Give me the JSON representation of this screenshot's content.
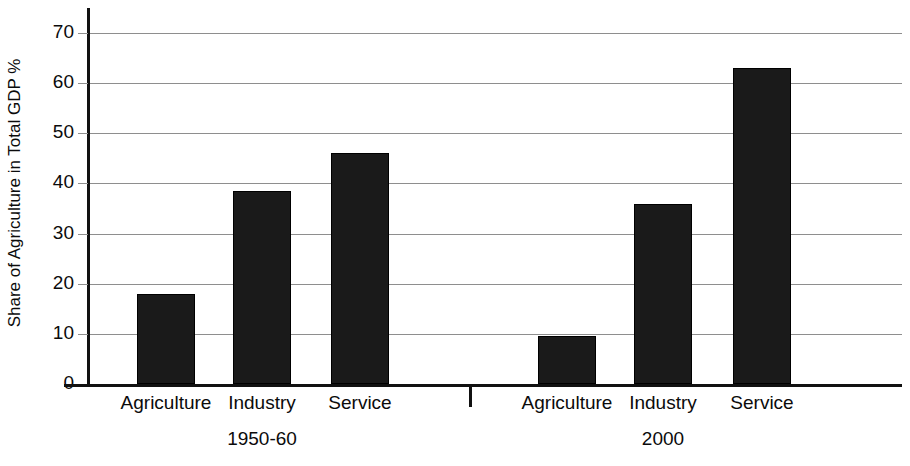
{
  "chart_data": {
    "type": "bar",
    "title": "",
    "xlabel": "",
    "ylabel": "Share of Agriculture in Total GDP %",
    "ylim": [
      0,
      75
    ],
    "yticks": [
      0,
      10,
      20,
      30,
      40,
      50,
      60,
      70
    ],
    "ytick_labels": [
      "0",
      "10",
      "20",
      "30",
      "40",
      "50",
      "60",
      "70"
    ],
    "grid": true,
    "legend": "none",
    "categories": [
      "Agriculture",
      "Industry",
      "Service"
    ],
    "groups": [
      {
        "label": "1950-60",
        "bars": [
          {
            "category": "Agriculture",
            "value": 18
          },
          {
            "category": "Industry",
            "value": 38.5
          },
          {
            "category": "Service",
            "value": 46
          }
        ]
      },
      {
        "label": "2000",
        "bars": [
          {
            "category": "Agriculture",
            "value": 9.5
          },
          {
            "category": "Industry",
            "value": 36
          },
          {
            "category": "Service",
            "value": 63
          }
        ]
      }
    ],
    "series": [
      {
        "name": "1950-60",
        "values": [
          18,
          38.5,
          46
        ]
      },
      {
        "name": "2000",
        "values": [
          9.5,
          36,
          63
        ]
      }
    ],
    "colors": {
      "bar_fill": "#1a1a1a",
      "gridline": "#8e8e8e",
      "axis": "#111111",
      "background": "#ffffff",
      "text": "#0b0b0b"
    }
  }
}
